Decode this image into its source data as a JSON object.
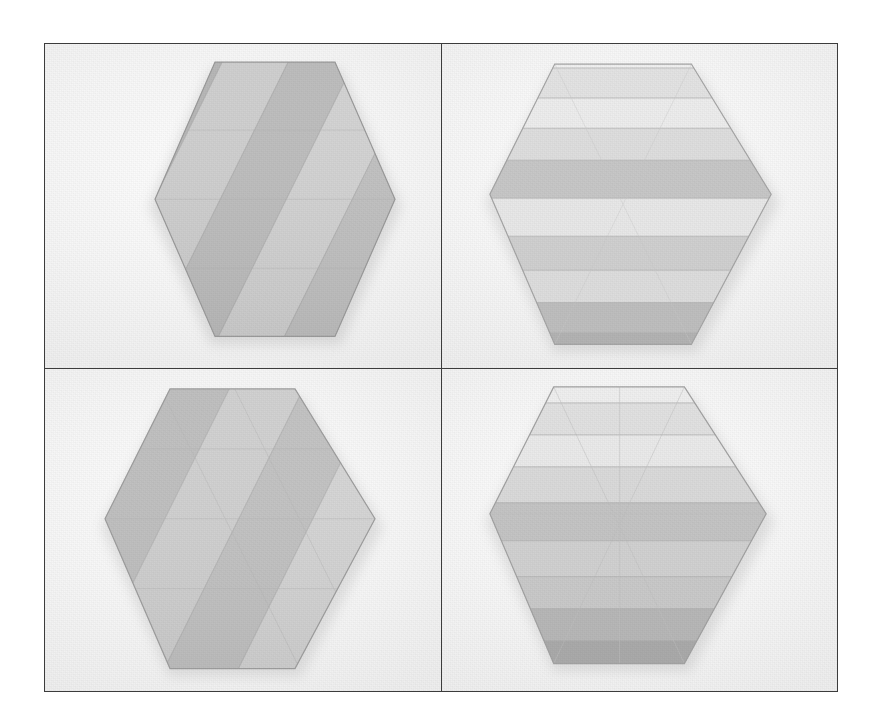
{
  "figure": {
    "layout": {
      "rows": 2,
      "columns": 2,
      "frame_border_color": "#3c3c3c"
    },
    "frame": {
      "x": 44,
      "y": 43,
      "width": 794,
      "height": 649
    },
    "background_color": "#ffffff",
    "photo_background_color": "#f6f6f6",
    "cells": [
      {
        "id": "cell-top-left",
        "position": "top-left",
        "subject": "pleated-hexagon",
        "pleat_direction": "diagonal",
        "pleat_angle_deg": 62,
        "pleat_count": 7,
        "hexagon_orientation": "pointy-left-right",
        "overall_tone": "mid-grey",
        "band_colors": [
          "#c4c4c4",
          "#b3b3b3",
          "#cfcfcf",
          "#bcbcbc",
          "#d4d4d4",
          "#c0c0c0",
          "#cacaca"
        ],
        "outline_color": "#9a9a9a",
        "shadow": "soft drop shadow lower-left"
      },
      {
        "id": "cell-top-right",
        "position": "top-right",
        "subject": "pleated-hexagon",
        "pleat_direction": "horizontal",
        "pleat_angle_deg": 0,
        "pleat_count": 9,
        "hexagon_orientation": "pointy-left-right",
        "overall_tone": "light-to-dark gradient downward",
        "band_colors": [
          "#f0f0f0",
          "#e2e2e2",
          "#ececec",
          "#dddddd",
          "#c6c6c6",
          "#e7e7e7",
          "#cfcfcf",
          "#dcdcdc",
          "#bdbdbd",
          "#b2b2b2"
        ],
        "outline_color": "#a5a5a5",
        "shadow": "soft drop shadow lower-right"
      },
      {
        "id": "cell-bottom-left",
        "position": "bottom-left",
        "subject": "pleated-hexagon",
        "pleat_direction": "diagonal",
        "pleat_angle_deg": 62,
        "pleat_count": 6,
        "hexagon_orientation": "pointy-left-right",
        "overall_tone": "mid-grey, triangular facet creases visible",
        "band_colors": [
          "#c9c9c9",
          "#bdbdbd",
          "#d2d2d2",
          "#c2c2c2",
          "#d6d6d6",
          "#c6c6c6"
        ],
        "outline_color": "#9e9e9e",
        "shadow": "soft drop shadow lower-left"
      },
      {
        "id": "cell-bottom-right",
        "position": "bottom-right",
        "subject": "pleated-hexagon",
        "pleat_direction": "horizontal",
        "pleat_angle_deg": 0,
        "pleat_count": 9,
        "hexagon_orientation": "pointy-left-right",
        "overall_tone": "light-to-dark gradient downward with triangular facets",
        "band_colors": [
          "#eeeeee",
          "#e0e0e0",
          "#e9e9e9",
          "#d9d9d9",
          "#c3c3c3",
          "#d0d0d0",
          "#c8c8c8",
          "#b6b6b6",
          "#a9a9a9"
        ],
        "outline_color": "#a2a2a2",
        "shadow": "soft drop shadow lower-right"
      }
    ]
  }
}
